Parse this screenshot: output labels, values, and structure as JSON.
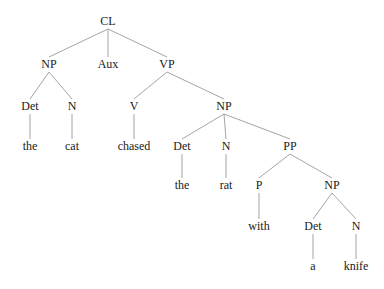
{
  "figure": {
    "kind": "syntax-tree",
    "sentence": "the cat chased the rat with a knife",
    "background_color": "#ffffff",
    "edge_color": "#9a9a9a",
    "text_color": "#1a1a1a"
  },
  "tree": {
    "nodes": [
      {
        "id": "n0",
        "label": "CL",
        "type": "nonterminal",
        "x": 108,
        "y": 25,
        "level": 0
      },
      {
        "id": "n1",
        "label": "NP",
        "type": "nonterminal",
        "x": 49,
        "y": 68,
        "level": 1
      },
      {
        "id": "n2",
        "label": "Aux",
        "type": "nonterminal",
        "x": 108,
        "y": 68,
        "level": 1
      },
      {
        "id": "n3",
        "label": "VP",
        "type": "nonterminal",
        "x": 167,
        "y": 68,
        "level": 1
      },
      {
        "id": "n4",
        "label": "Det",
        "type": "nonterminal",
        "x": 30,
        "y": 110,
        "level": 2
      },
      {
        "id": "n5",
        "label": "N",
        "type": "nonterminal",
        "x": 72,
        "y": 110,
        "level": 2
      },
      {
        "id": "n6",
        "label": "V",
        "type": "nonterminal",
        "x": 134,
        "y": 110,
        "level": 2
      },
      {
        "id": "n7",
        "label": "NP",
        "type": "nonterminal",
        "x": 224,
        "y": 110,
        "level": 2
      },
      {
        "id": "n8",
        "label": "the",
        "type": "terminal",
        "x": 30,
        "y": 150,
        "level": 3
      },
      {
        "id": "n9",
        "label": "cat",
        "type": "terminal",
        "x": 72,
        "y": 150,
        "level": 3
      },
      {
        "id": "n10",
        "label": "chased",
        "type": "terminal",
        "x": 134,
        "y": 150,
        "level": 3
      },
      {
        "id": "n11",
        "label": "Det",
        "type": "nonterminal",
        "x": 182,
        "y": 150,
        "level": 3
      },
      {
        "id": "n12",
        "label": "N",
        "type": "nonterminal",
        "x": 226,
        "y": 150,
        "level": 3
      },
      {
        "id": "n13",
        "label": "PP",
        "type": "nonterminal",
        "x": 290,
        "y": 150,
        "level": 3
      },
      {
        "id": "n14",
        "label": "the",
        "type": "terminal",
        "x": 182,
        "y": 189,
        "level": 4
      },
      {
        "id": "n15",
        "label": "rat",
        "type": "terminal",
        "x": 226,
        "y": 189,
        "level": 4
      },
      {
        "id": "n16",
        "label": "P",
        "type": "nonterminal",
        "x": 259,
        "y": 189,
        "level": 4
      },
      {
        "id": "n17",
        "label": "NP",
        "type": "nonterminal",
        "x": 332,
        "y": 189,
        "level": 4
      },
      {
        "id": "n18",
        "label": "with",
        "type": "terminal",
        "x": 259,
        "y": 230,
        "level": 5
      },
      {
        "id": "n19",
        "label": "Det",
        "type": "nonterminal",
        "x": 313,
        "y": 230,
        "level": 5
      },
      {
        "id": "n20",
        "label": "N",
        "type": "nonterminal",
        "x": 356,
        "y": 230,
        "level": 5
      },
      {
        "id": "n21",
        "label": "a",
        "type": "terminal",
        "x": 313,
        "y": 270,
        "level": 6
      },
      {
        "id": "n22",
        "label": "knife",
        "type": "terminal",
        "x": 356,
        "y": 270,
        "level": 6
      }
    ],
    "edges": [
      {
        "from": "n0",
        "to": "n1"
      },
      {
        "from": "n0",
        "to": "n2"
      },
      {
        "from": "n0",
        "to": "n3"
      },
      {
        "from": "n1",
        "to": "n4"
      },
      {
        "from": "n1",
        "to": "n5"
      },
      {
        "from": "n3",
        "to": "n6"
      },
      {
        "from": "n3",
        "to": "n7"
      },
      {
        "from": "n4",
        "to": "n8"
      },
      {
        "from": "n5",
        "to": "n9"
      },
      {
        "from": "n6",
        "to": "n10"
      },
      {
        "from": "n7",
        "to": "n11"
      },
      {
        "from": "n7",
        "to": "n12"
      },
      {
        "from": "n7",
        "to": "n13"
      },
      {
        "from": "n2",
        "to": "n10x",
        "skip": true
      },
      {
        "from": "n11",
        "to": "n14"
      },
      {
        "from": "n12",
        "to": "n15"
      },
      {
        "from": "n13",
        "to": "n16"
      },
      {
        "from": "n13",
        "to": "n17"
      },
      {
        "from": "n16",
        "to": "n18"
      },
      {
        "from": "n17",
        "to": "n19"
      },
      {
        "from": "n17",
        "to": "n20"
      },
      {
        "from": "n19",
        "to": "n21"
      },
      {
        "from": "n20",
        "to": "n22"
      }
    ]
  }
}
